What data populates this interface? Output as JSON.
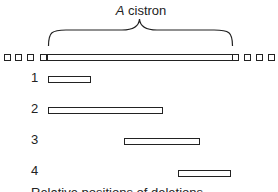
{
  "title": {
    "italic": "A",
    "rest": " cistron"
  },
  "deletions": [
    {
      "label": "1",
      "start": 48,
      "end": 91
    },
    {
      "label": "2",
      "start": 48,
      "end": 163
    },
    {
      "label": "3",
      "start": 124,
      "end": 200
    },
    {
      "label": "4",
      "start": 178,
      "end": 231
    }
  ],
  "caption": "Relative positions of deletions"
}
